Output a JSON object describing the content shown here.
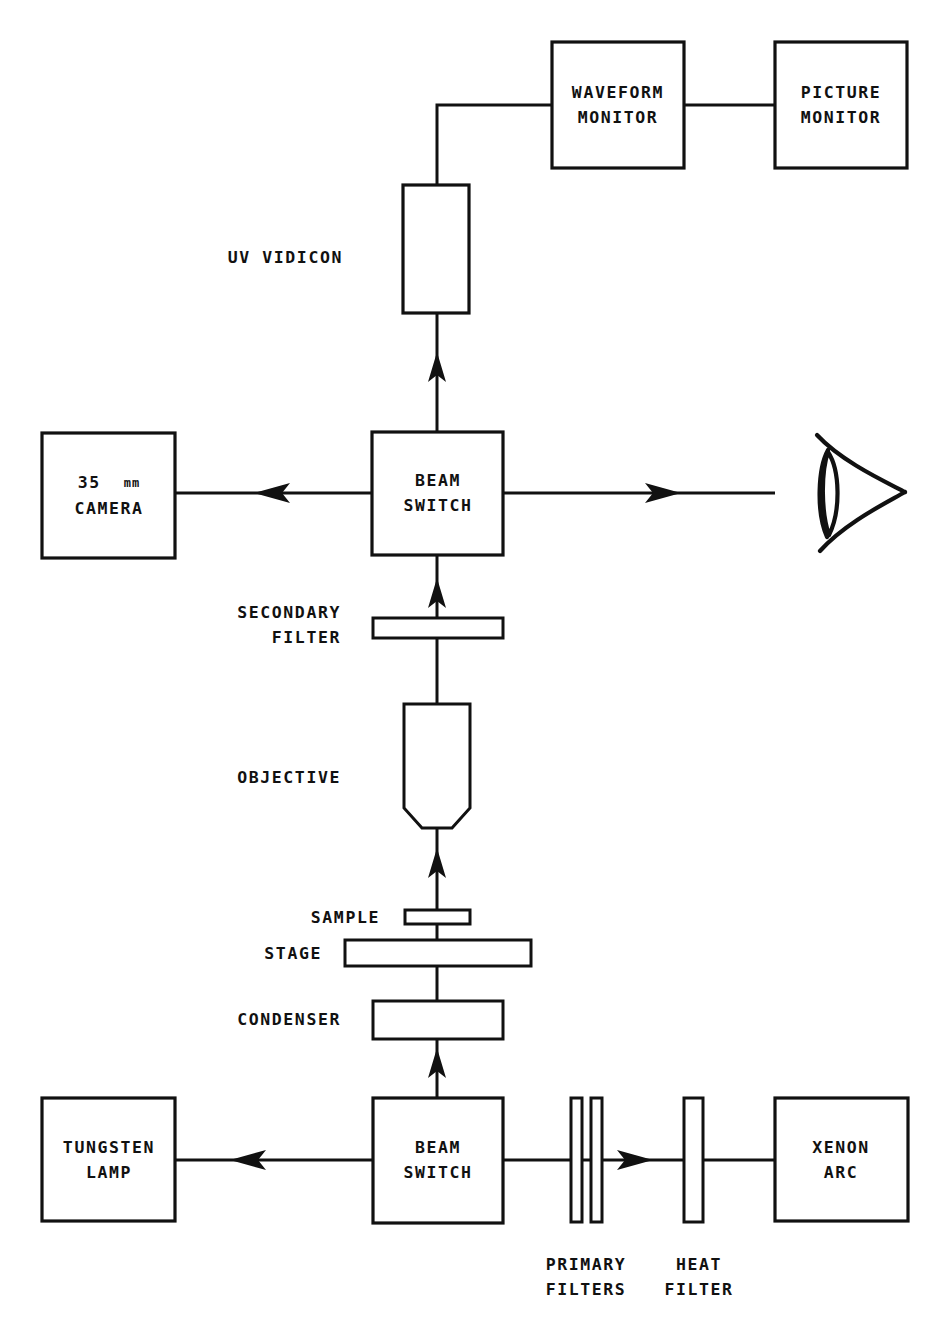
{
  "diagram": {
    "stroke_color": "#111111",
    "background_color": "#ffffff",
    "blocks": {
      "waveform_monitor": {
        "line1": "WAVEFORM",
        "line2": "MONITOR"
      },
      "picture_monitor": {
        "line1": "PICTURE",
        "line2": "MONITOR"
      },
      "uv_vidicon": {
        "label": "UV VIDICON"
      },
      "beam_switch_upper": {
        "line1": "BEAM",
        "line2": "SWITCH"
      },
      "camera": {
        "line1_num": "35",
        "line1_unit": "mm",
        "line2": "CAMERA"
      },
      "secondary_filter": {
        "line1": "SECONDARY",
        "line2": "FILTER"
      },
      "objective": {
        "label": "OBJECTIVE"
      },
      "sample": {
        "label": "SAMPLE"
      },
      "stage": {
        "label": "STAGE"
      },
      "condenser": {
        "label": "CONDENSER"
      },
      "tungsten_lamp": {
        "line1": "TUNGSTEN",
        "line2": "LAMP"
      },
      "beam_switch_lower": {
        "line1": "BEAM",
        "line2": "SWITCH"
      },
      "primary_filters": {
        "line1": "PRIMARY",
        "line2": "FILTERS"
      },
      "heat_filter": {
        "line1": "HEAT",
        "line2": "FILTER"
      },
      "xenon_arc": {
        "line1": "XENON",
        "line2": "ARC"
      },
      "eye": {
        "label": "eye-observer-symbol"
      }
    }
  }
}
